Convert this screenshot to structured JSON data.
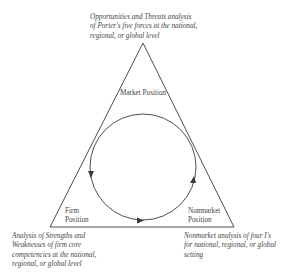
{
  "diagram": {
    "vertices": {
      "market": {
        "label": "Market Position"
      },
      "firm": {
        "label_line1": "Firm",
        "label_line2": "Position"
      },
      "nonmarket": {
        "label_line1": "Nonmarket",
        "label_line2": "Position"
      }
    },
    "notes": {
      "top": {
        "line1": "Opportunities and Threats analysis",
        "line2": "of Porter's five forces at the national,",
        "line3": "regional, or global level"
      },
      "bottom_left": {
        "line1": "Analysis of Strengths and",
        "line2": "Weaknesses of firm core",
        "line3": "competencies at the national,",
        "line4": "regional, or global level"
      },
      "bottom_right": {
        "line1": "Nonmarket analysis of four I's",
        "line2": "for national, regional, or global",
        "line3": "setting"
      }
    },
    "cycle": {
      "direction": "counterclockwise",
      "arrows": 3
    },
    "colors": {
      "stroke": "#3a3a3a",
      "text": "#3f3f3f",
      "background": "#ffffff"
    }
  }
}
